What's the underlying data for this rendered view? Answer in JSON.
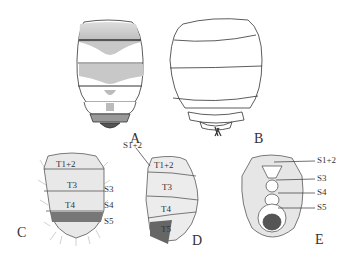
{
  "figure": {
    "panels": [
      {
        "id": "A",
        "label": "A",
        "description": "dorsal view of abdomen, shaded"
      },
      {
        "id": "B",
        "label": "B",
        "description": "dorsal outline of abdomen"
      },
      {
        "id": "C",
        "label": "C",
        "description": "setose abdomen, dorsal view"
      },
      {
        "id": "D",
        "label": "D",
        "description": "setose abdomen, lateral view"
      },
      {
        "id": "E",
        "label": "E",
        "description": "setose abdomen, ventral view"
      }
    ],
    "labels": {
      "C": {
        "t12": "T1+2",
        "t3": "T3",
        "t4": "T4",
        "s3": "S3",
        "s4": "S4",
        "s5": "S5"
      },
      "D": {
        "s12": "S1+2",
        "t12": "T1+2",
        "t3": "T3",
        "t4": "T4",
        "t5": "T5"
      },
      "E": {
        "s12": "S1+2",
        "s3": "S3",
        "s4": "S4",
        "s5": "S5"
      }
    },
    "colors": {
      "ink": "#333333",
      "shade": "#bbbbbb",
      "background": "#ffffff"
    }
  }
}
